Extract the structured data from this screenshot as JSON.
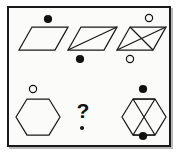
{
  "puzzle": {
    "kind": "visual-analogy-matrix",
    "frame": {
      "border_color": "#1a1a1a",
      "background_color": "#fbfbfa",
      "shadow_color": "#b9b9b9"
    },
    "missing_cell_label": "?",
    "rows": [
      {
        "row_index": 1,
        "shape": "parallelogram",
        "cells": [
          {
            "cell_index": 1,
            "shape": "parallelogram",
            "internal_lines": 0,
            "internal_line_description": "none",
            "markers": [
              {
                "position": "above",
                "style": "filled",
                "color": "#111111"
              }
            ]
          },
          {
            "cell_index": 2,
            "shape": "parallelogram",
            "internal_lines": 1,
            "internal_line_description": "one diagonal",
            "markers": [
              {
                "position": "below",
                "style": "filled",
                "color": "#111111"
              }
            ]
          },
          {
            "cell_index": 3,
            "shape": "parallelogram",
            "internal_lines": 2,
            "internal_line_description": "two crossing diagonals",
            "markers": [
              {
                "position": "above",
                "style": "hollow",
                "color": "#111111"
              },
              {
                "position": "below",
                "style": "hollow",
                "color": "#111111"
              }
            ]
          }
        ]
      },
      {
        "row_index": 2,
        "shape": "hexagon",
        "cells": [
          {
            "cell_index": 1,
            "shape": "hexagon",
            "internal_lines": 0,
            "internal_line_description": "none",
            "markers": [
              {
                "position": "above",
                "style": "hollow",
                "color": "#111111"
              }
            ]
          },
          {
            "cell_index": 2,
            "shape": "missing",
            "internal_lines": 0,
            "internal_line_description": "unknown",
            "markers": []
          },
          {
            "cell_index": 3,
            "shape": "hexagon",
            "internal_lines": 4,
            "internal_line_description": "crossing diagonals with top and bottom chords",
            "markers": [
              {
                "position": "above",
                "style": "filled",
                "color": "#111111"
              },
              {
                "position": "below",
                "style": "filled",
                "color": "#111111"
              }
            ]
          }
        ]
      }
    ]
  }
}
